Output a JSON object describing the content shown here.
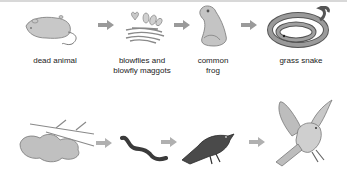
{
  "diagram": {
    "type": "food-chains",
    "colors": {
      "organism_fill": "#c4c4c4",
      "organism_stroke": "#777777",
      "arrow": "#9a9a9a",
      "dark_organism": "#3a3a3a",
      "text": "#222222"
    },
    "chain1": {
      "organisms": [
        {
          "label": "dead animal",
          "icon": "dead-mouse-icon"
        },
        {
          "label": "blowflies and blowfly maggots",
          "label_lines": [
            "blowflies and",
            "blowfly maggots"
          ],
          "icon": "blowfly-maggots-icon"
        },
        {
          "label": "common frog",
          "label_lines": [
            "common",
            "frog"
          ],
          "icon": "frog-icon"
        },
        {
          "label": "grass snake",
          "icon": "snake-icon"
        }
      ]
    },
    "chain2": {
      "organisms": [
        {
          "label": "",
          "icon": "dead-leaves-twigs-icon"
        },
        {
          "label": "",
          "icon": "earthworm-icon"
        },
        {
          "label": "",
          "icon": "blackbird-icon"
        },
        {
          "label": "",
          "icon": "hawk-icon"
        }
      ]
    }
  }
}
